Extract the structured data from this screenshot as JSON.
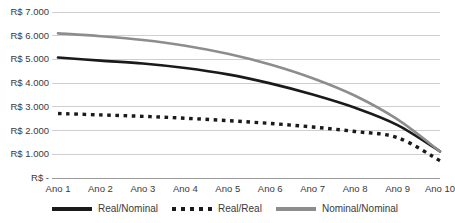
{
  "chart_data": {
    "type": "line",
    "title": "",
    "xlabel": "",
    "ylabel": "",
    "categories": [
      "Ano 1",
      "Ano 2",
      "Ano 3",
      "Ano 4",
      "Ano 5",
      "Ano 6",
      "Ano 7",
      "Ano 8",
      "Ano 9",
      "Ano 10"
    ],
    "ylim": [
      0,
      7000
    ],
    "ytick_labels": [
      "R$ 7.000",
      "R$ 6.000",
      "R$ 5.000",
      "R$ 4.000",
      "R$ 3.000",
      "R$ 2.000",
      "R$ 1.000",
      "R$ -"
    ],
    "ytick_values": [
      7000,
      6000,
      5000,
      4000,
      3000,
      2000,
      1000,
      0
    ],
    "grid": true,
    "legend_position": "bottom",
    "series": [
      {
        "name": "Real/Nominal",
        "style": "solid",
        "color": "#1a1a1a",
        "values": [
          5080,
          4950,
          4830,
          4640,
          4370,
          3990,
          3520,
          2960,
          2230,
          1120
        ]
      },
      {
        "name": "Real/Real",
        "style": "dotted",
        "color": "#1a1a1a",
        "values": [
          2720,
          2660,
          2600,
          2520,
          2420,
          2300,
          2150,
          1960,
          1700,
          730
        ]
      },
      {
        "name": "Nominal/Nominal",
        "style": "solid",
        "color": "#8d8d8d",
        "values": [
          6100,
          5980,
          5820,
          5580,
          5240,
          4790,
          4210,
          3470,
          2470,
          1120
        ]
      }
    ]
  }
}
